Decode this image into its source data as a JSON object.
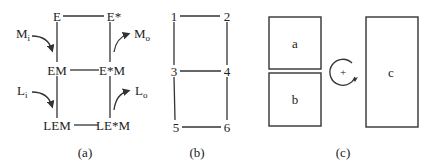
{
  "panels": {
    "a": {
      "caption": "(a)",
      "nodes": {
        "top_left": "E",
        "top_right": "E*",
        "mid_left": "EM",
        "mid_right": "E*M",
        "bot_left": "LEM",
        "bot_right": "LE*M"
      },
      "arrows": {
        "m_in": {
          "base": "M",
          "sub": "i"
        },
        "m_out": {
          "base": "M",
          "sub": "o"
        },
        "l_in": {
          "base": "L",
          "sub": "i"
        },
        "l_out": {
          "base": "L",
          "sub": "o"
        }
      }
    },
    "b": {
      "caption": "(b)",
      "nodes": [
        "1",
        "2",
        "3",
        "4",
        "5",
        "6"
      ]
    },
    "c": {
      "caption": "(c)",
      "boxes": {
        "a": "a",
        "b": "b",
        "c": "c"
      },
      "rotation_symbol": "+"
    }
  }
}
